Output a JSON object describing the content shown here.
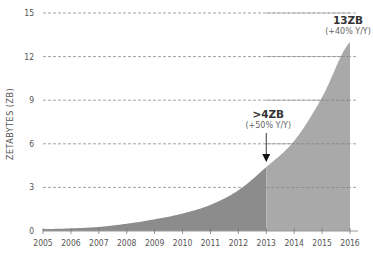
{
  "chart_data": {
    "type": "area",
    "title": "",
    "xlabel": "",
    "ylabel": "ZETABYTES (ZB)",
    "x": [
      2005,
      2006,
      2007,
      2008,
      2009,
      2010,
      2011,
      2012,
      2013,
      2014,
      2015,
      2016
    ],
    "series": [
      {
        "name": "Data volume",
        "values": [
          0.13,
          0.18,
          0.28,
          0.5,
          0.8,
          1.2,
          1.8,
          2.8,
          4.4,
          6.2,
          9.2,
          13.0
        ]
      }
    ],
    "ylim": [
      0,
      15
    ],
    "yticks": [
      0,
      3,
      6,
      9,
      12,
      15
    ],
    "xticks": [
      "2005",
      "2006",
      "2007",
      "2008",
      "2009",
      "2010",
      "2011",
      "2012",
      "2013",
      "2014",
      "2015",
      "2016"
    ],
    "grid": "horizontal dashed",
    "split_year": 2013,
    "colors": {
      "historical": "#8c8c8c",
      "projected": "#a9a9a9",
      "grid": "#8a8a8a",
      "axis": "#999999"
    },
    "annotations": [
      {
        "x": 2013,
        "label": ">4ZB",
        "sublabel": "(+50% Y/Y)",
        "arrow": true
      },
      {
        "x": 2016,
        "label": "13ZB",
        "sublabel": "(+40% Y/Y)",
        "arrow": false
      }
    ]
  }
}
